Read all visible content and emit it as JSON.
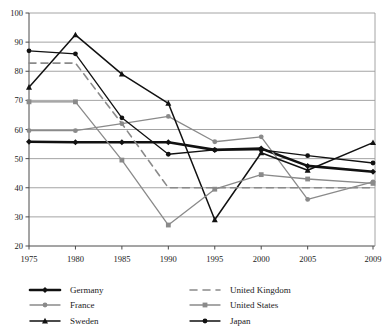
{
  "chart_data": {
    "type": "line",
    "title": "",
    "xlabel": "",
    "ylabel": "",
    "x": [
      1975,
      1980,
      1985,
      1990,
      1995,
      2000,
      2005,
      2009
    ],
    "xticklabels": [
      "1975",
      "1980",
      "1985",
      "1990",
      "1995",
      "2000",
      "2005",
      "2009"
    ],
    "yticklabels": [
      "20",
      "30",
      "40",
      "50",
      "60",
      "70",
      "80",
      "90",
      "100"
    ],
    "yticks": [
      20,
      30,
      40,
      50,
      60,
      70,
      80,
      90,
      100
    ],
    "ylim": [
      20,
      100
    ],
    "grid": "horizontal",
    "legend_position": "below",
    "series": [
      {
        "name": "Germany",
        "color": "#111111",
        "marker": "diamond",
        "dash": "solid",
        "width": 2.6,
        "values": [
          55.8,
          55.6,
          55.6,
          55.6,
          53.0,
          53.5,
          47.5,
          45.5
        ]
      },
      {
        "name": "France",
        "color": "#8a8a8a",
        "marker": "circle",
        "dash": "solid",
        "width": 1.3,
        "values": [
          59.6,
          59.6,
          62.0,
          64.5,
          55.8,
          57.5,
          36.0,
          42.0
        ]
      },
      {
        "name": "Sweden",
        "color": "#111111",
        "marker": "triangle",
        "dash": "solid",
        "width": 1.5,
        "values": [
          74.5,
          92.5,
          79.0,
          69.0,
          29.0,
          52.0,
          46.0,
          55.5
        ]
      },
      {
        "name": "United Kingdom",
        "color": "#8a8a8a",
        "marker": "none",
        "dash": "dashed",
        "width": 1.6,
        "values": [
          82.8,
          82.8,
          62.0,
          40.0,
          40.0,
          40.0,
          40.0,
          40.0
        ]
      },
      {
        "name": "United States",
        "color": "#8a8a8a",
        "marker": "square",
        "dash": "solid",
        "width": 1.3,
        "values": [
          69.5,
          69.5,
          49.5,
          27.2,
          39.5,
          44.5,
          43.0,
          41.5
        ]
      },
      {
        "name": "Japan",
        "color": "#111111",
        "marker": "circle",
        "dash": "solid",
        "width": 1.3,
        "values": [
          87.0,
          86.0,
          64.0,
          51.5,
          53.0,
          53.0,
          51.0,
          48.5
        ]
      }
    ]
  },
  "legend": {
    "columns": [
      {
        "items": [
          {
            "label": "Germany",
            "series": 0
          },
          {
            "label": "France",
            "series": 1
          },
          {
            "label": "Sweden",
            "series": 2
          }
        ]
      },
      {
        "items": [
          {
            "label": "United Kingdom",
            "series": 3
          },
          {
            "label": "United States",
            "series": 4
          },
          {
            "label": "Japan",
            "series": 5
          }
        ]
      }
    ]
  }
}
